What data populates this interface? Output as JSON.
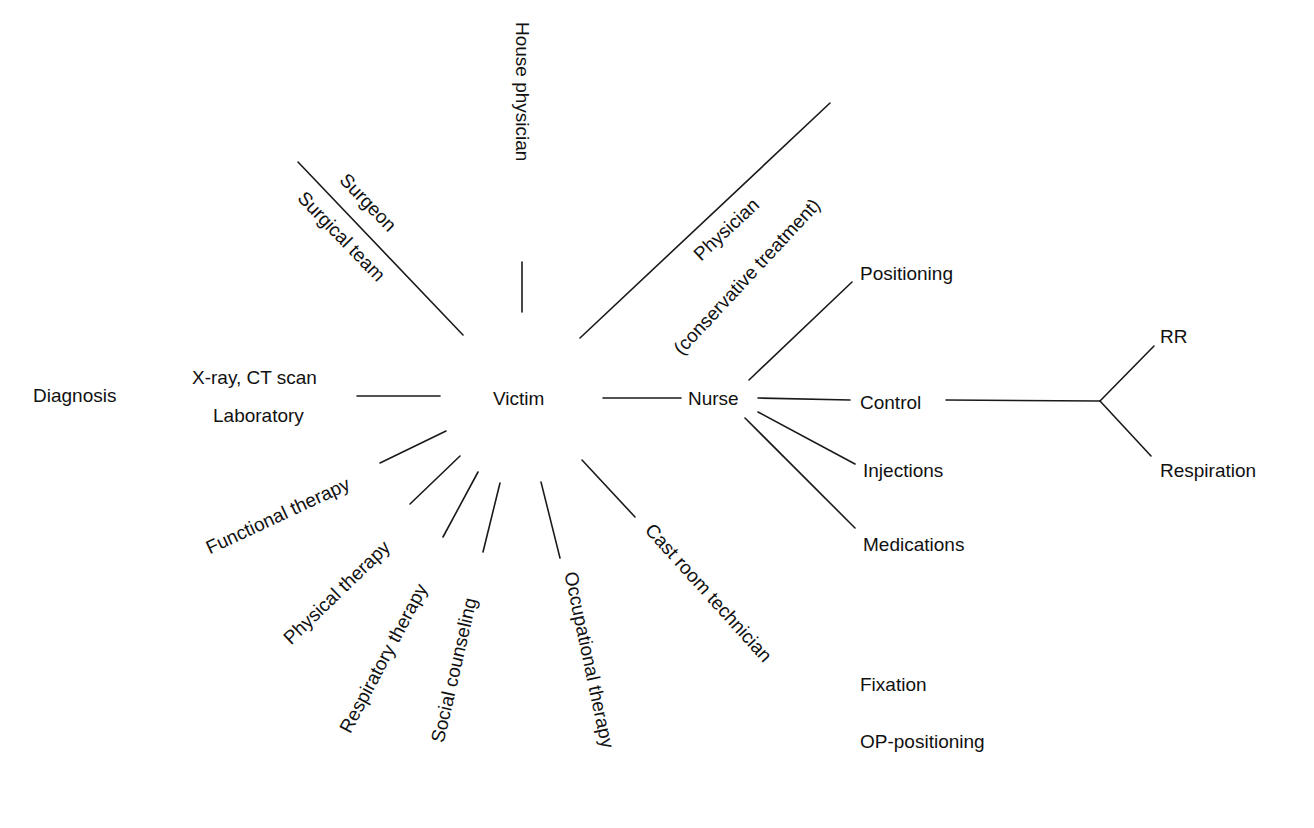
{
  "center": "Victim",
  "diagnosis": {
    "label": "Diagnosis",
    "items": [
      "X-ray, CT scan",
      "Laboratory"
    ]
  },
  "spokes": {
    "surgeon": "Surgeon",
    "surgical_team": "Surgical team",
    "house_physician": "House physician",
    "physician": "Physician",
    "conservative_treatment": "(conservative treatment)",
    "functional_therapy": "Functional therapy",
    "physical_therapy": "Physical therapy",
    "respiratory_therapy": "Respiratory therapy",
    "social_counseling": "Social counseling",
    "occupational_therapy": "Occupational therapy",
    "cast_room_technician": "Cast room technician"
  },
  "nurse": {
    "label": "Nurse",
    "tasks": [
      "Positioning",
      "Control",
      "Injections",
      "Medications"
    ],
    "control_branches": [
      "RR",
      "Respiration"
    ]
  },
  "cast_room_tasks": [
    "Fixation",
    "OP-positioning"
  ]
}
